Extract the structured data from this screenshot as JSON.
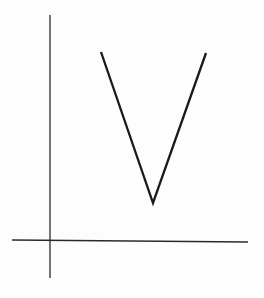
{
  "figure": {
    "background": "#fdfdfd",
    "axis_color": "#2a2a2a",
    "curve_color": "#1a1a1a"
  },
  "axes": {
    "y_axis": {
      "x": 50,
      "y1": 15,
      "y2": 278
    },
    "x_axis": {
      "x1": 12,
      "y1": 240,
      "x2": 248,
      "y2": 242
    }
  },
  "curve": {
    "points": [
      [
        101,
        52
      ],
      [
        153,
        203
      ],
      [
        206,
        53
      ]
    ]
  }
}
